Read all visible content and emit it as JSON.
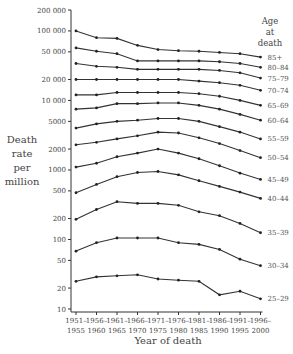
{
  "chart_data": {
    "type": "line",
    "title": "",
    "xlabel": "Year of death",
    "ylabel": "Death rate per million",
    "ylabel_lines": [
      "Death",
      "rate",
      "per",
      "million"
    ],
    "yscale": "log",
    "ylim": [
      10,
      200000
    ],
    "yticks": [
      10,
      20,
      50,
      100,
      200,
      500,
      1000,
      2000,
      5000,
      10000,
      20000,
      50000,
      100000,
      200000
    ],
    "ytick_labels": [
      "10",
      "20",
      "50",
      "100",
      "200",
      "500",
      "1000",
      "2000",
      "5000",
      "10 000",
      "20 000",
      "50 000",
      "100 000",
      "200 000"
    ],
    "categories": [
      "1951–1955",
      "1956–1960",
      "1961–1965",
      "1966–1970",
      "1971–1975",
      "1976–1980",
      "1981–1985",
      "1986–1990",
      "1991–1995",
      "1996–2000"
    ],
    "xtick_top": [
      "1951–",
      "1956–",
      "1961–",
      "1966–",
      "1971–",
      "1976–",
      "1981–",
      "1986–",
      "1991–",
      "1996–"
    ],
    "xtick_bottom": [
      "1955",
      "1960",
      "1965",
      "1970",
      "1975",
      "1980",
      "1985",
      "1990",
      "1995",
      "2000"
    ],
    "legend_title": [
      "Age",
      "at",
      "death"
    ],
    "legend_position": "right (labels at series ends)",
    "grid": false,
    "series": [
      {
        "name": "85+",
        "values": [
          100000,
          80000,
          78000,
          62000,
          54000,
          52000,
          51000,
          49000,
          47000,
          42000
        ]
      },
      {
        "name": "80–84",
        "values": [
          57000,
          51000,
          47000,
          37000,
          37000,
          37000,
          37000,
          36000,
          34000,
          30000
        ]
      },
      {
        "name": "75–79",
        "values": [
          34000,
          31000,
          30000,
          28000,
          28000,
          28000,
          28000,
          27000,
          25000,
          21000
        ]
      },
      {
        "name": "70–74",
        "values": [
          20000,
          20000,
          20000,
          20000,
          20000,
          20000,
          19000,
          18000,
          16500,
          14000
        ]
      },
      {
        "name": "65–69",
        "values": [
          12000,
          12000,
          13000,
          13000,
          13000,
          13000,
          12500,
          11500,
          10000,
          8500
        ]
      },
      {
        "name": "60–64",
        "values": [
          7500,
          7800,
          9000,
          9000,
          9200,
          9200,
          8500,
          7500,
          6300,
          5200
        ]
      },
      {
        "name": "55–59",
        "values": [
          4000,
          4600,
          5000,
          5200,
          5500,
          5500,
          5000,
          4200,
          3500,
          2800
        ]
      },
      {
        "name": "50–54",
        "values": [
          2300,
          2500,
          2800,
          3100,
          3500,
          3400,
          2900,
          2400,
          1900,
          1500
        ]
      },
      {
        "name": "45–49",
        "values": [
          1100,
          1250,
          1550,
          1750,
          2000,
          1750,
          1450,
          1150,
          900,
          730
        ]
      },
      {
        "name": "40–44",
        "values": [
          470,
          620,
          800,
          920,
          950,
          850,
          700,
          580,
          480,
          390
        ]
      },
      {
        "name": "35–39",
        "values": [
          195,
          270,
          350,
          330,
          330,
          310,
          250,
          220,
          170,
          125
        ]
      },
      {
        "name": "30–34",
        "values": [
          68,
          90,
          105,
          105,
          105,
          90,
          85,
          72,
          52,
          42
        ]
      },
      {
        "name": "25–29",
        "values": [
          25,
          29,
          30,
          31,
          27,
          26,
          25,
          16,
          18,
          14
        ]
      }
    ]
  }
}
